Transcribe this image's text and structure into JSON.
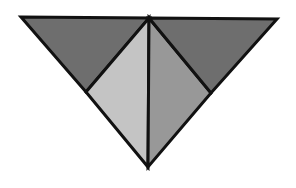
{
  "diagram": {
    "type": "geometric-decomposition",
    "canvas": {
      "width": 296,
      "height": 188,
      "background": "#ffffff"
    },
    "stroke": {
      "color": "#111111",
      "width": 3
    },
    "vertices": {
      "top_left": [
        21,
        17
      ],
      "top_center": [
        149,
        18
      ],
      "top_right": [
        277,
        19
      ],
      "bottom": [
        148,
        167
      ],
      "left_mid": [
        86,
        92
      ],
      "right_mid": [
        211,
        93
      ]
    },
    "pieces": [
      {
        "id": "left-outer-triangle",
        "points": "21,17 149,18 86,92",
        "fill": "#6e6e6e"
      },
      {
        "id": "left-inner-triangle",
        "points": "86,92 149,18 148,167",
        "fill": "#c4c4c4"
      },
      {
        "id": "right-inner-triangle",
        "points": "149,18 211,93 148,167",
        "fill": "#989898"
      },
      {
        "id": "right-outer-triangle",
        "points": "149,18 277,19 211,93",
        "fill": "#6e6e6e"
      }
    ]
  }
}
